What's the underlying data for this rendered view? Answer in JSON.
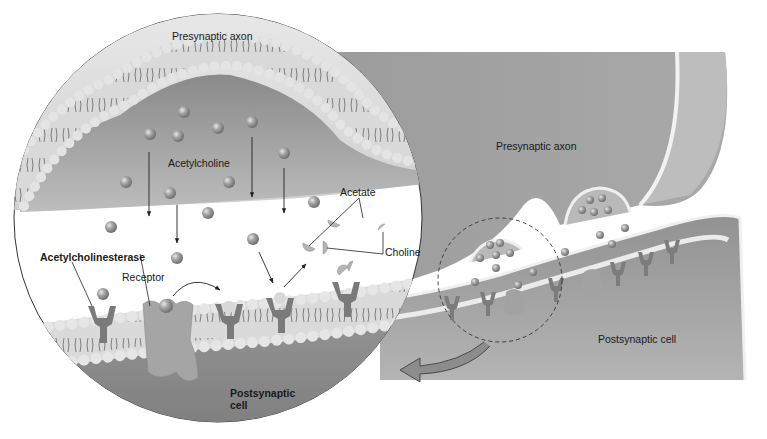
{
  "diagram": {
    "zoom_view": {
      "labels": {
        "presynaptic_axon": "Presynaptic axon",
        "acetylcholine": "Acetylcholine",
        "acetate": "Acetate",
        "choline": "Choline",
        "acetylcholinesterase": "Acetylcholinesterase",
        "receptor": "Receptor",
        "postsynaptic_cell_line1": "Postsynaptic",
        "postsynaptic_cell_line2": "cell"
      }
    },
    "overview": {
      "labels": {
        "presynaptic_axon": "Presynaptic axon",
        "postsynaptic_cell": "Postsynaptic cell"
      }
    },
    "colors": {
      "cytoplasm_dark": "#8f8f8f",
      "cytoplasm_mid": "#a8a8a8",
      "membrane_head": "#e6e6e6",
      "membrane_band": "#cfcfcf",
      "molecule": "#9a9a9a",
      "receptor": "#7d7d7d",
      "cleft": "#ffffff",
      "outline": "#333333"
    }
  }
}
